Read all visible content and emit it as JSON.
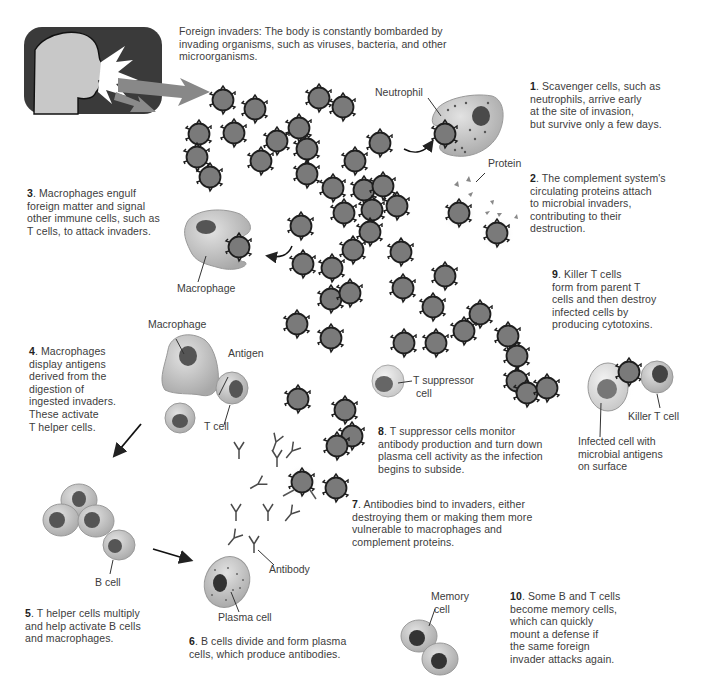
{
  "diagram": {
    "topic": "Immune response to foreign invaders",
    "intro": {
      "lines": [
        "Foreign invaders: The body is constantly bombarded by",
        "invading organisms, such as viruses, bacteria, and other",
        "microorganisms."
      ]
    },
    "steps": [
      {
        "num": "1",
        "lines": [
          ". Scavenger cells, such as",
          "neutrophils, arrive early",
          "at the site of invasion,",
          "but survive only a few days."
        ]
      },
      {
        "num": "2",
        "lines": [
          ". The complement system's",
          "circulating proteins attach",
          "to microbial invaders,",
          "contributing to their",
          "destruction."
        ]
      },
      {
        "num": "3",
        "lines": [
          ". Macrophages engulf",
          "foreign matter and signal",
          "other immune cells, such as",
          "T cells, to attack invaders."
        ]
      },
      {
        "num": "4",
        "lines": [
          ". Macrophages",
          "display antigens",
          "derived from the",
          "digestion of",
          "ingested invaders.",
          "These activate",
          "T helper cells."
        ]
      },
      {
        "num": "5",
        "lines": [
          ". T helper cells multiply",
          "and help activate B cells",
          "and macrophages."
        ]
      },
      {
        "num": "6",
        "lines": [
          ". B cells divide and form plasma",
          "cells, which produce antibodies."
        ]
      },
      {
        "num": "7",
        "lines": [
          ". Antibodies bind to invaders, either",
          "destroying them or making them more",
          "vulnerable to macrophages and",
          "complement proteins."
        ]
      },
      {
        "num": "8",
        "lines": [
          ". T suppressor cells monitor",
          "antibody production and turn down",
          "plasma cell activity as the infection",
          "begins to subside."
        ]
      },
      {
        "num": "9",
        "lines": [
          ". Killer T cells",
          "form from parent T",
          "cells and then destroy",
          "infected cells by",
          "producing cytotoxins."
        ]
      },
      {
        "num": "10",
        "lines": [
          ". Some B and T cells",
          "become memory cells,",
          "which can quickly",
          "mount a defense if",
          "the same foreign",
          "invader attacks again."
        ]
      }
    ],
    "labels": {
      "neutrophil": "Neutrophil",
      "protein": "Protein",
      "macrophage_1": "Macrophage",
      "macrophage_2": "Macrophage",
      "antigen": "Antigen",
      "t_cell": "T cell",
      "t_suppressor": [
        "T suppressor",
        "cell"
      ],
      "killer_t_cell": "Killer T cell",
      "infected_cell": [
        "Infected cell with",
        "microbial antigens",
        "on surface"
      ],
      "b_cell": "B cell",
      "antibody": "Antibody",
      "plasma_cell": "Plasma cell",
      "memory_cell": [
        "Memory",
        "cell"
      ]
    },
    "colors": {
      "invader_fill": "#7a7a7a",
      "invader_stroke": "#1e1e1e",
      "cell_fill": "#c4c4c4",
      "nucleus_fill": "#5a5a5a",
      "panel_bg": "#3a3a3a",
      "silhouette": "#c8c8c8",
      "arrow": "#808080"
    }
  }
}
